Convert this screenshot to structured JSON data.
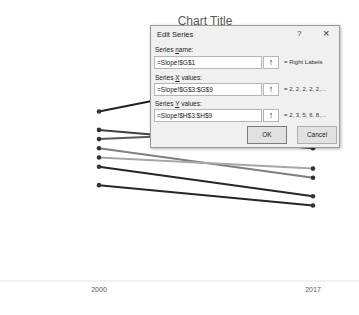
{
  "chart": {
    "title": "Chart Title",
    "categories": [
      "2000",
      "2017"
    ]
  },
  "chart_data": {
    "type": "line",
    "title": "Chart Title",
    "categories": [
      "2000",
      "2017"
    ],
    "xlabel": "",
    "ylabel": "",
    "grid": false,
    "note": "Slope chart; y-axis hidden. Values expressed in relative vertical position units (higher = larger).",
    "series": [
      {
        "name": "Series 1",
        "values": [
          9.2,
          11.5
        ],
        "color": "#222222"
      },
      {
        "name": "Series 2",
        "values": [
          8.2,
          7.2
        ],
        "color": "#404040"
      },
      {
        "name": "Series 3",
        "values": [
          7.7,
          8.2
        ],
        "color": "#595959"
      },
      {
        "name": "Series 4",
        "values": [
          7.2,
          5.6
        ],
        "color": "#7f7f7f"
      },
      {
        "name": "Series 5",
        "values": [
          6.7,
          6.1
        ],
        "color": "#a6a6a6"
      },
      {
        "name": "Series 6",
        "values": [
          6.2,
          4.6
        ],
        "color": "#262626"
      },
      {
        "name": "Series 7",
        "values": [
          5.2,
          4.1
        ],
        "color": "#262626"
      }
    ],
    "ylim": [
      0,
      14
    ]
  },
  "dialog": {
    "title": "Edit Series",
    "help": "?",
    "close": "×",
    "series_name": {
      "label_pre": "Series ",
      "label_key": "n",
      "label_post": "ame:",
      "value": "=Slope!$G$1",
      "preview": "= Right Labels"
    },
    "series_x": {
      "label_pre": "Series ",
      "label_key": "X",
      "label_post": " values:",
      "value": "=Slope!$G$3:$G$9",
      "preview": "= 2, 2, 2, 2, 2,..."
    },
    "series_y": {
      "label_pre": "Series ",
      "label_key": "Y",
      "label_post": " values:",
      "value": "=Slope!$H$3:$H$9",
      "preview": "= 2, 3, 5, 6, 8,..."
    },
    "range_button_icon": "↑",
    "ok": "OK",
    "cancel": "Cancel"
  }
}
